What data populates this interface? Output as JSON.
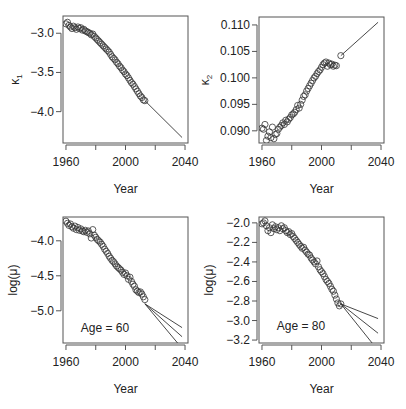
{
  "figure": {
    "width": 406,
    "height": 409,
    "background": "#ffffff",
    "ink": "#333333"
  },
  "chart_data": [
    {
      "type": "scatter",
      "id": "kappa1",
      "ylabel": "κ1",
      "ylabel_main": "κ",
      "ylabel_sub": "1",
      "xlabel": "Year",
      "xlim": [
        1958,
        2042
      ],
      "ylim": [
        -4.4,
        -2.78
      ],
      "xticks": [
        1960,
        1980,
        2000,
        2020,
        2040
      ],
      "xticklabels": [
        "1960",
        "",
        "2000",
        "",
        "2040"
      ],
      "yticks": [
        -3.0,
        -3.5,
        -4.0
      ],
      "yticklabels": [
        "−3.0",
        "−3.5",
        "−4.0"
      ],
      "annotation": "",
      "box": {
        "left": 63,
        "top": 16,
        "right": 188,
        "bottom": 143
      },
      "points": {
        "x": [
          1960,
          1961,
          1962,
          1963,
          1964,
          1965,
          1966,
          1967,
          1968,
          1969,
          1970,
          1971,
          1972,
          1973,
          1974,
          1975,
          1976,
          1977,
          1978,
          1979,
          1980,
          1981,
          1982,
          1983,
          1984,
          1985,
          1986,
          1987,
          1988,
          1989,
          1990,
          1991,
          1992,
          1993,
          1994,
          1995,
          1996,
          1997,
          1998,
          1999,
          2000,
          2001,
          2002,
          2003,
          2004,
          2005,
          2006,
          2007,
          2008,
          2009,
          2010,
          2011,
          2012,
          2013
        ],
        "y": [
          -2.88,
          -2.86,
          -2.9,
          -2.92,
          -2.94,
          -2.91,
          -2.93,
          -2.95,
          -2.92,
          -2.94,
          -2.93,
          -2.96,
          -2.95,
          -2.97,
          -2.98,
          -2.99,
          -3.0,
          -3.02,
          -3.01,
          -3.04,
          -3.06,
          -3.08,
          -3.1,
          -3.12,
          -3.14,
          -3.16,
          -3.18,
          -3.2,
          -3.22,
          -3.24,
          -3.27,
          -3.3,
          -3.32,
          -3.34,
          -3.37,
          -3.39,
          -3.42,
          -3.44,
          -3.47,
          -3.49,
          -3.52,
          -3.54,
          -3.57,
          -3.6,
          -3.63,
          -3.65,
          -3.68,
          -3.71,
          -3.74,
          -3.77,
          -3.8,
          -3.82,
          -3.85,
          -3.86
        ]
      },
      "projections": [
        {
          "x": [
            2013,
            2038
          ],
          "y": [
            -3.86,
            -4.33
          ]
        }
      ]
    },
    {
      "type": "scatter",
      "id": "kappa2",
      "ylabel": "κ2",
      "ylabel_main": "κ",
      "ylabel_sub": "2",
      "xlabel": "Year",
      "xlim": [
        1958,
        2042
      ],
      "ylim": [
        0.0877,
        0.1115
      ],
      "xticks": [
        1960,
        1980,
        2000,
        2020,
        2040
      ],
      "xticklabels": [
        "1960",
        "",
        "2000",
        "",
        "2040"
      ],
      "yticks": [
        0.09,
        0.095,
        0.1,
        0.105,
        0.11
      ],
      "yticklabels": [
        "0.090",
        "0.095",
        "0.100",
        "0.105",
        "0.110"
      ],
      "annotation": "",
      "box": {
        "left": 259,
        "top": 17,
        "right": 384,
        "bottom": 143
      },
      "points": {
        "x": [
          1960,
          1961,
          1962,
          1963,
          1964,
          1965,
          1966,
          1967,
          1968,
          1969,
          1970,
          1971,
          1972,
          1973,
          1974,
          1975,
          1976,
          1977,
          1978,
          1979,
          1980,
          1981,
          1982,
          1983,
          1984,
          1985,
          1986,
          1987,
          1988,
          1989,
          1990,
          1991,
          1992,
          1993,
          1994,
          1995,
          1996,
          1997,
          1998,
          1999,
          2000,
          2001,
          2002,
          2003,
          2004,
          2005,
          2006,
          2007,
          2008,
          2009,
          2010,
          2013
        ],
        "y": [
          0.0905,
          0.0903,
          0.0912,
          0.0882,
          0.089,
          0.0898,
          0.0887,
          0.0907,
          0.0885,
          0.0893,
          0.0895,
          0.0903,
          0.0907,
          0.091,
          0.0915,
          0.0912,
          0.092,
          0.0917,
          0.0922,
          0.0925,
          0.093,
          0.0932,
          0.0935,
          0.094,
          0.0948,
          0.0943,
          0.095,
          0.0958,
          0.0965,
          0.0968,
          0.0975,
          0.098,
          0.0985,
          0.099,
          0.0995,
          0.1,
          0.1003,
          0.1008,
          0.1012,
          0.1015,
          0.102,
          0.1025,
          0.1028,
          0.103,
          0.1022,
          0.1028,
          0.1025,
          0.1026,
          0.1022,
          0.1024,
          0.1023,
          0.1042
        ]
      },
      "projections": [
        {
          "x": [
            2013,
            2038
          ],
          "y": [
            0.1042,
            0.1105
          ]
        }
      ]
    },
    {
      "type": "scatter",
      "id": "age60",
      "ylabel": "log(μ)",
      "ylabel_main": "log(μ)",
      "ylabel_sub": "",
      "xlabel": "Year",
      "xlim": [
        1958,
        2042
      ],
      "ylim": [
        -5.46,
        -3.66
      ],
      "xticks": [
        1960,
        1980,
        2000,
        2020,
        2040
      ],
      "xticklabels": [
        "1960",
        "",
        "2000",
        "",
        "2040"
      ],
      "yticks": [
        -4.0,
        -4.5,
        -5.0
      ],
      "yticklabels": [
        "−4.0",
        "−4.5",
        "−5.0"
      ],
      "annotation": "Age = 60",
      "annotation_pos": {
        "x": 1970,
        "y": -5.3
      },
      "box": {
        "left": 63,
        "top": 217,
        "right": 188,
        "bottom": 343
      },
      "points": {
        "x": [
          1960,
          1961,
          1962,
          1963,
          1964,
          1965,
          1966,
          1967,
          1968,
          1969,
          1970,
          1971,
          1972,
          1973,
          1974,
          1975,
          1976,
          1977,
          1978,
          1979,
          1980,
          1981,
          1982,
          1983,
          1984,
          1985,
          1986,
          1987,
          1988,
          1989,
          1990,
          1991,
          1992,
          1993,
          1994,
          1995,
          1996,
          1997,
          1998,
          1999,
          2000,
          2001,
          2002,
          2003,
          2004,
          2005,
          2006,
          2007,
          2008,
          2009,
          2010,
          2011,
          2012,
          2013
        ],
        "y": [
          -3.72,
          -3.75,
          -3.78,
          -3.76,
          -3.8,
          -3.82,
          -3.79,
          -3.84,
          -3.81,
          -3.85,
          -3.83,
          -3.86,
          -3.87,
          -3.85,
          -3.88,
          -3.86,
          -3.9,
          -3.96,
          -3.84,
          -3.92,
          -3.95,
          -3.98,
          -4.0,
          -4.02,
          -4.05,
          -4.08,
          -4.12,
          -4.15,
          -4.18,
          -4.22,
          -4.25,
          -4.28,
          -4.3,
          -4.33,
          -4.36,
          -4.38,
          -4.4,
          -4.42,
          -4.45,
          -4.48,
          -4.46,
          -4.5,
          -4.55,
          -4.52,
          -4.58,
          -4.62,
          -4.65,
          -4.7,
          -4.72,
          -4.74,
          -4.73,
          -4.76,
          -4.8,
          -4.84
        ]
      },
      "projections": [
        {
          "x": [
            2013,
            2038
          ],
          "y": [
            -4.9,
            -5.24
          ]
        },
        {
          "x": [
            2013,
            2038
          ],
          "y": [
            -4.9,
            -5.37
          ]
        },
        {
          "x": [
            2013,
            2035
          ],
          "y": [
            -4.9,
            -5.46
          ]
        }
      ]
    },
    {
      "type": "scatter",
      "id": "age80",
      "ylabel": "log(μ)",
      "ylabel_main": "log(μ)",
      "ylabel_sub": "",
      "xlabel": "Year",
      "xlim": [
        1958,
        2042
      ],
      "ylim": [
        -3.23,
        -1.94
      ],
      "xticks": [
        1960,
        1980,
        2000,
        2020,
        2040
      ],
      "xticklabels": [
        "1960",
        "",
        "2000",
        "",
        "2040"
      ],
      "yticks": [
        -2.0,
        -2.2,
        -2.4,
        -2.6,
        -2.8,
        -3.0,
        -3.2
      ],
      "yticklabels": [
        "−2.0",
        "−2.2",
        "−2.4",
        "−2.6",
        "−2.8",
        "−3.0",
        "−3.2"
      ],
      "annotation": "Age = 80",
      "annotation_pos": {
        "x": 1970,
        "y": -3.1
      },
      "box": {
        "left": 259,
        "top": 217,
        "right": 384,
        "bottom": 343
      },
      "points": {
        "x": [
          1960,
          1961,
          1962,
          1963,
          1964,
          1965,
          1966,
          1967,
          1968,
          1969,
          1970,
          1971,
          1972,
          1973,
          1974,
          1975,
          1976,
          1977,
          1978,
          1979,
          1980,
          1981,
          1982,
          1983,
          1984,
          1985,
          1986,
          1987,
          1988,
          1989,
          1990,
          1991,
          1992,
          1993,
          1994,
          1995,
          1996,
          1997,
          1998,
          1999,
          2000,
          2001,
          2002,
          2003,
          2004,
          2005,
          2006,
          2007,
          2008,
          2009,
          2010,
          2011,
          2012,
          2013
        ],
        "y": [
          -2.01,
          -2.0,
          -1.98,
          -2.03,
          -2.08,
          -2.05,
          -2.1,
          -2.02,
          -2.06,
          -2.04,
          -2.07,
          -2.05,
          -2.08,
          -2.03,
          -2.06,
          -2.05,
          -2.08,
          -2.1,
          -2.09,
          -2.12,
          -2.11,
          -2.14,
          -2.16,
          -2.18,
          -2.2,
          -2.22,
          -2.24,
          -2.26,
          -2.25,
          -2.28,
          -2.3,
          -2.32,
          -2.33,
          -2.36,
          -2.38,
          -2.4,
          -2.42,
          -2.39,
          -2.45,
          -2.48,
          -2.5,
          -2.52,
          -2.55,
          -2.58,
          -2.6,
          -2.62,
          -2.65,
          -2.68,
          -2.7,
          -2.74,
          -2.78,
          -2.82,
          -2.85,
          -2.83
        ]
      },
      "projections": [
        {
          "x": [
            2013,
            2038
          ],
          "y": [
            -2.83,
            -2.98
          ]
        },
        {
          "x": [
            2013,
            2038
          ],
          "y": [
            -2.83,
            -3.13
          ]
        },
        {
          "x": [
            2013,
            2034
          ],
          "y": [
            -2.83,
            -3.23
          ]
        }
      ]
    }
  ]
}
